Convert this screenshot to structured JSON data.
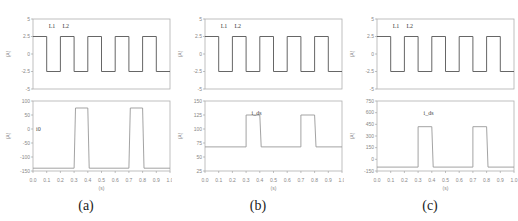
{
  "figure": {
    "captions": [
      "(a)",
      "(b)",
      "(c)"
    ]
  },
  "chart_data": [
    {
      "panel": "(a)",
      "type": "line",
      "subplots": [
        {
          "position": "top",
          "title": "",
          "xlabel": "",
          "ylabel": "(A)",
          "xlim": [
            0,
            1
          ],
          "ylim": [
            -5,
            5
          ],
          "yticks": [
            "5",
            "2.5",
            "0",
            "-2.5",
            "-5"
          ],
          "annotations": [
            "L1",
            "L2"
          ],
          "series": [
            {
              "name": "square wave",
              "x": [
                0,
                0.1,
                0.1,
                0.2,
                0.2,
                0.3,
                0.3,
                0.4,
                0.4,
                0.5,
                0.5,
                0.6,
                0.6,
                0.7,
                0.7,
                0.8,
                0.8,
                0.9,
                0.9,
                1.0
              ],
              "y": [
                2.5,
                2.5,
                -2.5,
                -2.5,
                2.5,
                2.5,
                -2.5,
                -2.5,
                2.5,
                2.5,
                -2.5,
                -2.5,
                2.5,
                2.5,
                -2.5,
                -2.5,
                2.5,
                2.5,
                -2.5,
                -2.5
              ]
            }
          ]
        },
        {
          "position": "bottom",
          "xlabel": "(s)",
          "ylabel": "(A)",
          "xlim": [
            0,
            1
          ],
          "xticks": [
            "0.0",
            "0.1",
            "0.2",
            "0.3",
            "0.4",
            "0.5",
            "0.6",
            "0.7",
            "0.8",
            "0.9",
            "1.0"
          ],
          "yticks": [
            "100",
            "50",
            "0",
            "-50",
            "-100",
            "-150"
          ],
          "annotations": [
            "i0"
          ],
          "series": [
            {
              "name": "pulse",
              "x": [
                0,
                0.3,
                0.31,
                0.4,
                0.41,
                0.7,
                0.71,
                0.8,
                0.81,
                1.0
              ],
              "y": [
                -140,
                -140,
                75,
                75,
                -140,
                -140,
                75,
                75,
                -140,
                -140
              ]
            }
          ]
        }
      ]
    },
    {
      "panel": "(b)",
      "type": "line",
      "subplots": [
        {
          "position": "top",
          "ylabel": "(A)",
          "xlim": [
            0,
            1
          ],
          "ylim": [
            -5,
            5
          ],
          "yticks": [
            "5",
            "2.5",
            "0",
            "-2.5",
            "-5"
          ],
          "annotations": [
            "L1",
            "L2"
          ],
          "series": [
            {
              "name": "square wave",
              "x": [
                0,
                0.1,
                0.1,
                0.2,
                0.2,
                0.3,
                0.3,
                0.4,
                0.4,
                0.5,
                0.5,
                0.6,
                0.6,
                0.7,
                0.7,
                0.8,
                0.8,
                0.9,
                0.9,
                1.0
              ],
              "y": [
                2.5,
                2.5,
                -2.5,
                -2.5,
                2.5,
                2.5,
                -2.5,
                -2.5,
                2.5,
                2.5,
                -2.5,
                -2.5,
                2.5,
                2.5,
                -2.5,
                -2.5,
                2.5,
                2.5,
                -2.5,
                -2.5
              ]
            }
          ]
        },
        {
          "position": "bottom",
          "xlabel": "(s)",
          "ylabel": "(A)",
          "xlim": [
            0,
            1
          ],
          "xticks": [
            "0.0",
            "0.1",
            "0.2",
            "0.3",
            "0.4",
            "0.5",
            "0.6",
            "0.7",
            "0.8",
            "0.9",
            "1.0"
          ],
          "yticks": [
            "150",
            "125",
            "100",
            "75",
            "50",
            "25"
          ],
          "annotations": [
            "i_ds"
          ],
          "series": [
            {
              "name": "pulse",
              "x": [
                0,
                0.3,
                0.3,
                0.4,
                0.41,
                0.7,
                0.7,
                0.8,
                0.81,
                1.0
              ],
              "y": [
                68,
                68,
                125,
                125,
                68,
                68,
                125,
                125,
                68,
                68
              ]
            }
          ]
        }
      ]
    },
    {
      "panel": "(c)",
      "type": "line",
      "subplots": [
        {
          "position": "top",
          "ylabel": "(A)",
          "xlim": [
            0,
            1
          ],
          "ylim": [
            -5,
            5
          ],
          "yticks": [
            "5",
            "2.5",
            "0",
            "-2.5",
            "-5"
          ],
          "annotations": [
            "L1",
            "L2"
          ],
          "series": [
            {
              "name": "square wave",
              "x": [
                0,
                0.1,
                0.1,
                0.2,
                0.2,
                0.3,
                0.3,
                0.4,
                0.4,
                0.5,
                0.5,
                0.6,
                0.6,
                0.7,
                0.7,
                0.8,
                0.8,
                0.9,
                0.9,
                1.0
              ],
              "y": [
                2.5,
                2.5,
                -2.5,
                -2.5,
                2.5,
                2.5,
                -2.5,
                -2.5,
                2.5,
                2.5,
                -2.5,
                -2.5,
                2.5,
                2.5,
                -2.5,
                -2.5,
                2.5,
                2.5,
                -2.5,
                -2.5
              ]
            }
          ]
        },
        {
          "position": "bottom",
          "xlabel": "(s)",
          "ylabel": "(A)",
          "xlim": [
            0,
            1
          ],
          "xticks": [
            "0.0",
            "0.1",
            "0.2",
            "0.3",
            "0.4",
            "0.5",
            "0.6",
            "0.7",
            "0.8",
            "0.9",
            "1.0"
          ],
          "yticks": [
            "750",
            "600",
            "450",
            "300",
            "150",
            "0",
            "-150"
          ],
          "annotations": [
            "i_ds"
          ],
          "series": [
            {
              "name": "pulse",
              "x": [
                0,
                0.3,
                0.3,
                0.4,
                0.41,
                0.7,
                0.7,
                0.8,
                0.81,
                1.0
              ],
              "y": [
                -100,
                -100,
                420,
                420,
                -100,
                -100,
                420,
                420,
                -100,
                -100
              ]
            }
          ]
        }
      ]
    }
  ]
}
